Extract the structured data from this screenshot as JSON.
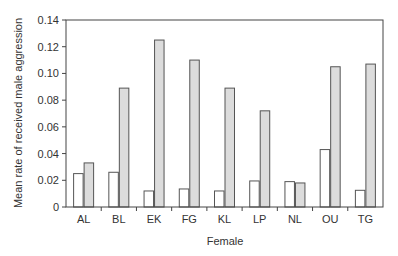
{
  "chart_data": {
    "type": "bar",
    "title": "",
    "xlabel": "Female",
    "ylabel": "Mean rate of received male aggression",
    "ylim": [
      0,
      0.14
    ],
    "yticks": [
      0,
      0.02,
      0.04,
      0.06,
      0.08,
      0.1,
      0.12,
      0.14
    ],
    "ytick_labels": [
      "0",
      "0.02",
      "0.04",
      "0.06",
      "0.08",
      "0.10",
      "0.12",
      "0.14"
    ],
    "categories": [
      "AL",
      "BL",
      "EK",
      "FG",
      "KL",
      "LP",
      "NL",
      "OU",
      "TG"
    ],
    "series": [
      {
        "name": "Series 1 (white)",
        "color": "#ffffff",
        "values": [
          0.025,
          0.026,
          0.012,
          0.0135,
          0.012,
          0.0195,
          0.019,
          0.043,
          0.0125
        ]
      },
      {
        "name": "Series 2 (grey)",
        "color": "#dcdcdc",
        "values": [
          0.033,
          0.089,
          0.125,
          0.11,
          0.089,
          0.072,
          0.018,
          0.105,
          0.107
        ]
      }
    ],
    "grid": false,
    "legend": null
  },
  "colors": {
    "axis": "#444444",
    "bar_stroke": "#555555"
  }
}
